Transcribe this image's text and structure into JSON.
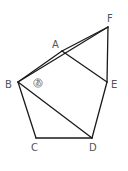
{
  "figure": {
    "width": 128,
    "height": 171,
    "line_color": "#1a1a1a",
    "label_color": "#555555",
    "vertices": {
      "A": {
        "x": 62,
        "y": 51,
        "label": "A",
        "lx": 52,
        "ly": 48
      },
      "B": {
        "x": 18,
        "y": 82,
        "label": "B",
        "lx": 5,
        "ly": 88
      },
      "C": {
        "x": 36,
        "y": 138,
        "label": "C",
        "lx": 31,
        "ly": 151
      },
      "D": {
        "x": 92,
        "y": 138,
        "label": "D",
        "lx": 89,
        "ly": 151
      },
      "E": {
        "x": 107,
        "y": 82,
        "label": "E",
        "lx": 111,
        "ly": 88
      },
      "F": {
        "x": 108,
        "y": 27,
        "label": "F",
        "lx": 107,
        "ly": 22
      }
    },
    "edges": [
      [
        "B",
        "F"
      ],
      [
        "B",
        "A"
      ],
      [
        "A",
        "F"
      ],
      [
        "A",
        "E"
      ],
      [
        "F",
        "E"
      ],
      [
        "E",
        "D"
      ],
      [
        "D",
        "C"
      ],
      [
        "C",
        "B"
      ],
      [
        "B",
        "D"
      ]
    ],
    "angle_marker": {
      "text": "あ",
      "x": 38,
      "y": 83,
      "at_vertex": "B"
    }
  }
}
